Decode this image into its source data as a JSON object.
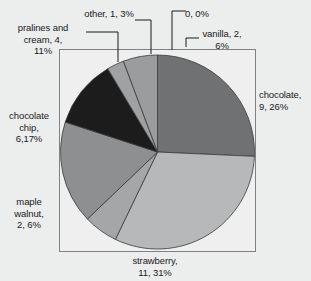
{
  "chart_data": {
    "type": "pie",
    "title": "",
    "subtitle": "",
    "xlabel": "",
    "ylabel": "",
    "legend_position": "none",
    "grid": false,
    "total": 35,
    "start_angle_deg": 0,
    "direction": "clockwise",
    "categories": [
      "chocolate",
      "strawberry",
      "maple walnut",
      "chocolate chip",
      "pralines and cream",
      "other",
      "0",
      "vanilla"
    ],
    "values": [
      9,
      11,
      2,
      6,
      4,
      1,
      0,
      2
    ],
    "percents": [
      26,
      31,
      6,
      17,
      11,
      3,
      0,
      6
    ],
    "colors": [
      "#6f7172",
      "#b6b8b9",
      "#a4a6a7",
      "#8d8f90",
      "#1c1c1c",
      "#9fa1a2",
      "#9fa1a2",
      "#9a9c9d"
    ],
    "slices": [
      {
        "name": "chocolate",
        "value": 9,
        "percent": 26,
        "color": "#6f7172",
        "label": "chocolate,\n9, 26%"
      },
      {
        "name": "strawberry",
        "value": 11,
        "percent": 31,
        "color": "#b6b8b9",
        "label": "strawberry,\n11, 31%"
      },
      {
        "name": "maple walnut",
        "value": 2,
        "percent": 6,
        "color": "#a4a6a7",
        "label": "maple\nwalnut,\n2, 6%"
      },
      {
        "name": "chocolate chip",
        "value": 6,
        "percent": 17,
        "color": "#8d8f90",
        "label": "chocolate\nchip,\n6,17%"
      },
      {
        "name": "pralines and cream",
        "value": 4,
        "percent": 11,
        "color": "#1c1c1c",
        "label": "pralines and\ncream, 4,\n11%"
      },
      {
        "name": "other",
        "value": 1,
        "percent": 3,
        "color": "#9fa1a2",
        "label": "other, 1, 3%"
      },
      {
        "name": "0",
        "value": 0,
        "percent": 0,
        "color": "#9fa1a2",
        "label": "0, 0%"
      },
      {
        "name": "vanilla",
        "value": 2,
        "percent": 6,
        "color": "#9a9c9d",
        "label": "vanilla, 2,\n6%"
      }
    ]
  },
  "labels": {
    "chocolate": "chocolate,\n9, 26%",
    "strawberry": "strawberry,\n11, 31%",
    "maple_walnut": "maple\nwalnut,\n2, 6%",
    "chocolate_chip": "chocolate\nchip,\n6,17%",
    "pralines_and_cream": "pralines and\ncream, 4,\n11%",
    "other": "other, 1, 3%",
    "zero": "0, 0%",
    "vanilla": "vanilla, 2,\n6%"
  },
  "style": {
    "background": "#eceded",
    "plot_area_fill": "#efefef",
    "plot_border": "#7f8182",
    "text_color": "#1b1b1b",
    "leader_line": "#1b1b1b",
    "slice_outline": "#3a3a3a"
  }
}
